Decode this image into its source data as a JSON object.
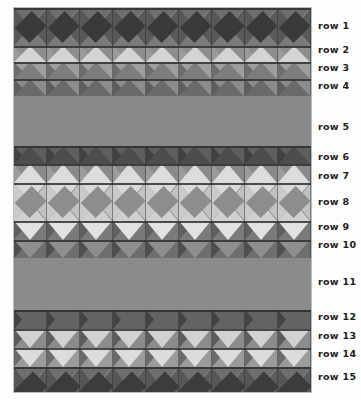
{
  "figure": {
    "background_color": "#fdfdfd",
    "panel": {
      "x": 14,
      "y": 8,
      "width": 297,
      "height": 384,
      "base_color": "#8a8a8a"
    }
  },
  "palette": {
    "darkest": "#343434",
    "dark": "#4a4a4a",
    "mid_dark": "#636363",
    "mid": "#808080",
    "light": "#a6a6a6",
    "lighter": "#c8c8c8",
    "lightest": "#dedede",
    "seam": "#2f2f2f"
  },
  "grid": {
    "columns": 9,
    "tile_width": 33
  },
  "rows": [
    {
      "id": 1,
      "label": "row 1",
      "height": 38,
      "pattern": "diamond",
      "colors": {
        "north": "#6e6e6e",
        "east": "#5a5a5a",
        "south": "#7a7a7a",
        "west": "#585858",
        "center": "#3a3a3a"
      }
    },
    {
      "id": 2,
      "label": "row 2",
      "height": 16,
      "pattern": "half-up",
      "colors": {
        "north": "#d4d4d4",
        "east": "#8e8e8e",
        "south": "#8e8e8e",
        "west": "#9a9a9a",
        "center": "#d4d4d4"
      }
    },
    {
      "id": 3,
      "label": "row 3",
      "height": 17,
      "pattern": "half-up",
      "colors": {
        "north": "#7d7d7d",
        "east": "#9e9e9e",
        "south": "#c6c6c6",
        "west": "#6d6d6d",
        "center": "#7d7d7d"
      }
    },
    {
      "id": 4,
      "label": "row 4",
      "height": 17,
      "pattern": "half-up",
      "colors": {
        "north": "#6a6a6a",
        "east": "#8c8c8c",
        "south": "#8a8a8a",
        "west": "#5e5e5e",
        "center": "#6a6a6a"
      }
    },
    {
      "id": 5,
      "label": "row 5",
      "height": 50,
      "pattern": "plain",
      "colors": {
        "fill": "#898989"
      }
    },
    {
      "id": 6,
      "label": "row 6",
      "height": 18,
      "pattern": "half-up",
      "colors": {
        "north": "#4d4d4d",
        "east": "#5e5e5e",
        "south": "#5e5e5e",
        "west": "#414141",
        "center": "#4d4d4d"
      }
    },
    {
      "id": 7,
      "label": "row 7",
      "height": 19,
      "pattern": "half-up",
      "colors": {
        "north": "#dcdcdc",
        "east": "#8a8a8a",
        "south": "#8a8a8a",
        "west": "#9c9c9c",
        "center": "#dcdcdc"
      }
    },
    {
      "id": 8,
      "label": "row 8",
      "height": 38,
      "pattern": "diamond",
      "colors": {
        "north": "#dadada",
        "east": "#c2c2c2",
        "south": "#d0d0d0",
        "west": "#cacaca",
        "center": "#8d8d8d"
      }
    },
    {
      "id": 9,
      "label": "row 9",
      "height": 19,
      "pattern": "half-down",
      "colors": {
        "north": "#6d6d6d",
        "east": "#7a7a7a",
        "south": "#e2e2e2",
        "west": "#5f5f5f",
        "center": "#e2e2e2"
      }
    },
    {
      "id": 10,
      "label": "row 10",
      "height": 18,
      "pattern": "half-down",
      "colors": {
        "north": "#5a5a5a",
        "east": "#6e6e6e",
        "south": "#8e8e8e",
        "west": "#4e4e4e",
        "center": "#8e8e8e"
      }
    },
    {
      "id": 11,
      "label": "row 11",
      "height": 52,
      "pattern": "plain",
      "colors": {
        "fill": "#8b8b8b"
      }
    },
    {
      "id": 12,
      "label": "row 12",
      "height": 19,
      "pattern": "half-down",
      "colors": {
        "north": "#4f4f4f",
        "east": "#636363",
        "south": "#636363",
        "west": "#434343",
        "center": "#636363"
      }
    },
    {
      "id": 13,
      "label": "row 13",
      "height": 19,
      "pattern": "half-down",
      "colors": {
        "north": "#6a6a6a",
        "east": "#8c8c8c",
        "south": "#d2d2d2",
        "west": "#5c5c5c",
        "center": "#d2d2d2"
      }
    },
    {
      "id": 14,
      "label": "row 14",
      "height": 19,
      "pattern": "half-down",
      "colors": {
        "north": "#787878",
        "east": "#9b9b9b",
        "south": "#dcdcdc",
        "west": "#6a6a6a",
        "center": "#dcdcdc"
      }
    },
    {
      "id": 15,
      "label": "row 15",
      "height": 43,
      "pattern": "diamond",
      "colors": {
        "north": "#6e6e6e",
        "east": "#5c5c5c",
        "south": "#7c7c7c",
        "west": "#565656",
        "center": "#3c3c3c"
      }
    }
  ],
  "labels": [
    {
      "text": "row 1",
      "y": 26
    },
    {
      "text": "row 2",
      "y": 50
    },
    {
      "text": "row 3",
      "y": 68
    },
    {
      "text": "row 4",
      "y": 86
    },
    {
      "text": "row 5",
      "y": 127
    },
    {
      "text": "row 6",
      "y": 157
    },
    {
      "text": "row 7",
      "y": 176
    },
    {
      "text": "row 8",
      "y": 202
    },
    {
      "text": "row 9",
      "y": 227
    },
    {
      "text": "row 10",
      "y": 245
    },
    {
      "text": "row 11",
      "y": 282
    },
    {
      "text": "row 12",
      "y": 317
    },
    {
      "text": "row 13",
      "y": 336
    },
    {
      "text": "row 14",
      "y": 354
    },
    {
      "text": "row 15",
      "y": 377
    }
  ]
}
